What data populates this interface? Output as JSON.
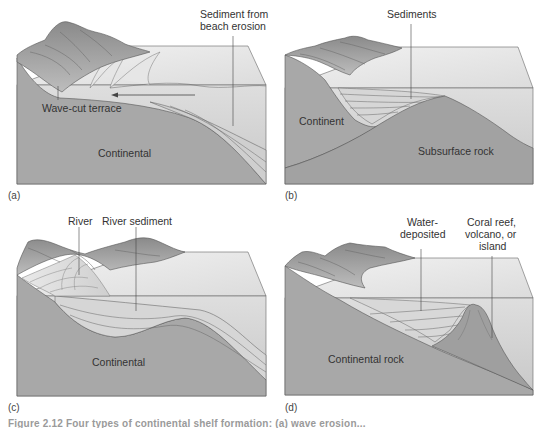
{
  "figure": {
    "colors": {
      "rock": "#a9a9a9",
      "rock_dark": "#8f8f8f",
      "water_top": "#e4e4e4",
      "water_front": "#cfcfcf",
      "sediment": "#d9d9d9",
      "mountain": "#9b9b9b",
      "mountain_light": "#c4c4c4",
      "line": "#555555",
      "text": "#333333"
    },
    "panels": [
      {
        "id": "a",
        "tag": "(a)",
        "labels": {
          "sediment_line1": "Sediment from",
          "sediment_line2": "beach erosion",
          "terrace": "Wave-cut terrace",
          "base": "Continental"
        }
      },
      {
        "id": "b",
        "tag": "(b)",
        "labels": {
          "sediments": "Sediments",
          "continent": "Continent",
          "subsurface": "Subsurface rock"
        }
      },
      {
        "id": "c",
        "tag": "(c)",
        "labels": {
          "river": "River",
          "river_sediment": "River sediment",
          "base": "Continental"
        }
      },
      {
        "id": "d",
        "tag": "(d)",
        "labels": {
          "water_line1": "Water-",
          "water_line2": "deposited",
          "coral_line1": "Coral reef,",
          "coral_line2": "volcano, or",
          "coral_line3": "island",
          "base": "Continental rock"
        }
      }
    ],
    "caption": "Figure 2.12  Four types of continental shelf formation: (a) wave erosion..."
  }
}
